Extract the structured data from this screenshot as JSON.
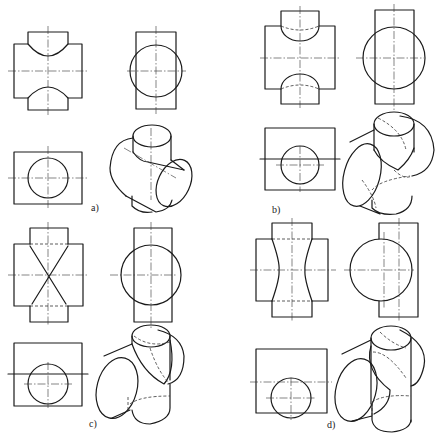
{
  "figure": {
    "colors": {
      "line": "#1a1a1a",
      "background": "#ffffff"
    },
    "panels": [
      {
        "id": "a",
        "label": "a)",
        "case": "vertical cylinder smaller than horizontal cylinder"
      },
      {
        "id": "b",
        "label": "b)",
        "case": "vertical cylinder smaller, offset intersection"
      },
      {
        "id": "c",
        "label": "c)",
        "case": "equal diameter cylinders, intersection projects as straight lines"
      },
      {
        "id": "d",
        "label": "d)",
        "case": "vertical cylinder larger than horizontal cylinder"
      }
    ]
  }
}
